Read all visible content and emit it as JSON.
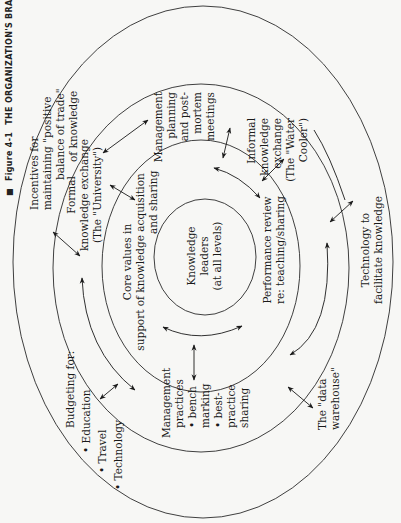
{
  "caption": {
    "marker": "■",
    "label": "Figure 4-1",
    "title": "THE ORGANIZATION'S BRAIN"
  },
  "center": {
    "lines": [
      "Knowledge",
      "leaders",
      "(at all levels)"
    ]
  },
  "ring3": {
    "core_values": [
      "Core values in",
      "support of knowledge acquisition",
      "and sharing"
    ],
    "performance_review": [
      "Performance review",
      "re: teaching/sharing"
    ]
  },
  "ring2": {
    "formal_exchange": [
      "Formal",
      "knowledge exchange",
      "(The \"University\")"
    ],
    "management_planning": [
      "Management",
      "planning",
      "and post-",
      "mortem",
      "meetings"
    ],
    "informal_exchange": [
      "Informal",
      "knowledge",
      "exchange",
      "(The \"Water",
      "Cooler\")"
    ],
    "management_practices": [
      "Management",
      "practices",
      "• bench",
      "  marking",
      "• best-",
      "  practice",
      "  sharing"
    ],
    "data_warehouse": [
      "The \"data",
      "warehouse\""
    ]
  },
  "ring1": {
    "incentives": [
      "Incentives for",
      "maintaining \"positive",
      "balance of trade\"",
      "of knowledge"
    ],
    "budgeting": [
      "Budgeting for:",
      "• Education",
      "• Travel",
      "• Technology"
    ],
    "technology": [
      "Technology to",
      "facilitate knowledge"
    ]
  },
  "colors": {
    "background": "#f7f7f5",
    "line": "#2a2a2a",
    "text": "#1a1a1a"
  }
}
